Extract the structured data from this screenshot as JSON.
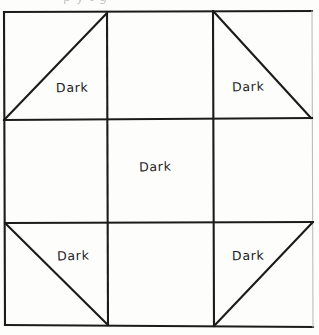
{
  "caption": {
    "text": "(partially cut off caption fragment)",
    "visible_fragment": "p y    t      g"
  },
  "block": {
    "title": "Quilt block piecing diagram",
    "grid_rows": 3,
    "grid_cols": 3,
    "ink_color": "#1b1b1b",
    "background_color": "#fdfdfc",
    "labels": {
      "top_left": "Dark",
      "top_right": "Dark",
      "center": "Dark",
      "bottom_left": "Dark",
      "bottom_right": "Dark"
    },
    "cells": [
      {
        "name": "top-left",
        "type": "half-square-triangle",
        "diagonal": "bottom-left-to-top-right",
        "label": "Dark"
      },
      {
        "name": "top-center",
        "type": "plain-square",
        "diagonal": "none",
        "label": ""
      },
      {
        "name": "top-right",
        "type": "half-square-triangle",
        "diagonal": "top-left-to-bottom-right",
        "label": "Dark"
      },
      {
        "name": "middle-left",
        "type": "plain-square",
        "diagonal": "none",
        "label": ""
      },
      {
        "name": "center",
        "type": "plain-square",
        "diagonal": "none",
        "label": "Dark"
      },
      {
        "name": "middle-right",
        "type": "plain-square",
        "diagonal": "none",
        "label": ""
      },
      {
        "name": "bottom-left",
        "type": "half-square-triangle",
        "diagonal": "top-left-to-bottom-right",
        "label": "Dark"
      },
      {
        "name": "bottom-center",
        "type": "plain-square",
        "diagonal": "none",
        "label": ""
      },
      {
        "name": "bottom-right",
        "type": "half-square-triangle",
        "diagonal": "bottom-left-to-top-right",
        "label": "Dark"
      }
    ]
  }
}
